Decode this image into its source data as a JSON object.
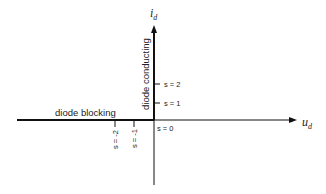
{
  "diagram": {
    "title": "",
    "axes": {
      "y_label_main": "i",
      "y_label_sub": "d",
      "x_label_main": "u",
      "x_label_sub": "d"
    },
    "regions": {
      "blocking": "diode blocking",
      "conducting": "diode conducting"
    },
    "ticks": {
      "origin": "s = 0",
      "pos1": "s = 1",
      "pos2": "s = 2",
      "neg1": "s = -1",
      "neg2": "s = -2"
    },
    "colors": {
      "stroke": "#111111",
      "text": "#222222",
      "background": "#ffffff"
    }
  }
}
